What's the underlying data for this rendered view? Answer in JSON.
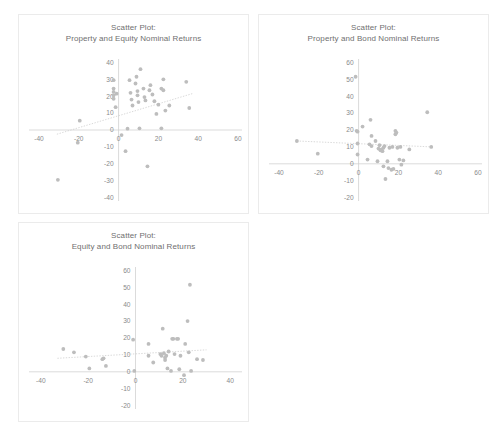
{
  "page": {
    "background": "#ffffff",
    "marker_color": "#bdbdbd",
    "axis_color": "#d2d2d2",
    "trend_color": "#cfcfcf",
    "label_color": "#8a8a8a",
    "title_color": "#6f6f6f",
    "panel_border_color": "#ebebeb"
  },
  "chart_data": [
    {
      "id": "property-equity",
      "type": "scatter",
      "title": "Scatter Plot:",
      "subtitle": "Property and Equity Nominal Returns",
      "xlabel": "",
      "ylabel": "",
      "xlim": [
        -45,
        62
      ],
      "ylim": [
        -42,
        42
      ],
      "xticks": [
        -40,
        -20,
        0,
        20,
        40,
        60
      ],
      "yticks": [
        -40,
        -30,
        -20,
        -10,
        0,
        10,
        20,
        30,
        40
      ],
      "grid": false,
      "legend": "none",
      "trendline": {
        "x0": -31,
        "y0": -2.5,
        "x1": 37,
        "y1": 21.5
      },
      "points": [
        [
          -30.5,
          -29.5
        ],
        [
          -20.5,
          -7.5
        ],
        [
          -19.5,
          5.5
        ],
        [
          -2.5,
          24.5
        ],
        [
          -2.5,
          22.5
        ],
        [
          -2.5,
          20.5
        ],
        [
          -2.5,
          18.5
        ],
        [
          -2.5,
          29.5
        ],
        [
          -1.5,
          13.5
        ],
        [
          -1.0,
          21.5
        ],
        [
          1.5,
          -3.0
        ],
        [
          3.5,
          -12.5
        ],
        [
          4.5,
          0.8
        ],
        [
          5.5,
          29.5
        ],
        [
          6.0,
          22.0
        ],
        [
          6.5,
          18.0
        ],
        [
          7.0,
          14.5
        ],
        [
          8.5,
          27.5
        ],
        [
          9.0,
          31.5
        ],
        [
          9.5,
          23.0
        ],
        [
          9.5,
          20.5
        ],
        [
          10.0,
          16.5
        ],
        [
          10.5,
          1.0
        ],
        [
          11.0,
          36.0
        ],
        [
          12.5,
          24.5
        ],
        [
          13.0,
          19.5
        ],
        [
          13.5,
          17.5
        ],
        [
          14.5,
          -21.5
        ],
        [
          15.5,
          23.5
        ],
        [
          16.0,
          26.5
        ],
        [
          17.0,
          21.0
        ],
        [
          18.0,
          17.0
        ],
        [
          19.0,
          9.5
        ],
        [
          20.0,
          15.0
        ],
        [
          21.5,
          1.0
        ],
        [
          21.5,
          24.5
        ],
        [
          22.5,
          23.5
        ],
        [
          22.5,
          30.0
        ],
        [
          23.5,
          11.5
        ],
        [
          25.5,
          14.5
        ],
        [
          34.0,
          28.5
        ],
        [
          35.5,
          13.0
        ]
      ]
    },
    {
      "id": "property-bond",
      "type": "scatter",
      "title": "Scatter Plot:",
      "subtitle": "Property and Bond Nominal Returns",
      "xlabel": "",
      "ylabel": "",
      "xlim": [
        -45,
        62
      ],
      "ylim": [
        -22,
        62
      ],
      "xticks": [
        -40,
        -20,
        0,
        20,
        40,
        60
      ],
      "yticks": [
        -20,
        -10,
        0,
        10,
        20,
        30,
        40,
        50,
        60
      ],
      "grid": false,
      "legend": "none",
      "trendline": {
        "x0": -31,
        "y0": 13.5,
        "x1": 37,
        "y1": 10.0
      },
      "points": [
        [
          -31.0,
          13.5
        ],
        [
          -20.5,
          6.0
        ],
        [
          -1.5,
          51.5
        ],
        [
          -1.0,
          19.5
        ],
        [
          -0.5,
          19.0
        ],
        [
          -0.5,
          12.0
        ],
        [
          -0.5,
          5.5
        ],
        [
          2.0,
          22.0
        ],
        [
          4.5,
          2.5
        ],
        [
          5.5,
          11.5
        ],
        [
          6.0,
          26.0
        ],
        [
          6.5,
          16.5
        ],
        [
          6.5,
          10.5
        ],
        [
          8.5,
          13.5
        ],
        [
          9.5,
          1.5
        ],
        [
          10.0,
          9.0
        ],
        [
          10.5,
          11.0
        ],
        [
          11.0,
          8.0
        ],
        [
          11.5,
          8.5
        ],
        [
          12.0,
          7.5
        ],
        [
          12.5,
          9.5
        ],
        [
          12.5,
          -1.5
        ],
        [
          13.0,
          10.5
        ],
        [
          13.5,
          -9.0
        ],
        [
          14.5,
          1.5
        ],
        [
          15.0,
          -2.5
        ],
        [
          15.5,
          9.5
        ],
        [
          16.5,
          -3.5
        ],
        [
          17.0,
          10.0
        ],
        [
          17.5,
          -3.0
        ],
        [
          18.5,
          19.5
        ],
        [
          18.5,
          17.5
        ],
        [
          19.0,
          18.5
        ],
        [
          19.5,
          9.5
        ],
        [
          20.5,
          2.5
        ],
        [
          21.0,
          10.0
        ],
        [
          21.5,
          -0.5
        ],
        [
          22.5,
          2.0
        ],
        [
          25.5,
          8.5
        ],
        [
          34.5,
          30.5
        ],
        [
          36.5,
          10.0
        ]
      ]
    },
    {
      "id": "equity-bond",
      "type": "scatter",
      "title": "Scatter Plot:",
      "subtitle": "Equity and Bond Nominal Returns",
      "xlabel": "",
      "ylabel": "",
      "xlim": [
        -45,
        45
      ],
      "ylim": [
        -22,
        62
      ],
      "xticks": [
        -40,
        -20,
        0,
        20,
        40
      ],
      "yticks": [
        -20,
        -10,
        0,
        10,
        20,
        30,
        40,
        50,
        60
      ],
      "grid": false,
      "legend": "none",
      "trendline": {
        "x0": -33,
        "y0": 8.0,
        "x1": 30,
        "y1": 13.0
      },
      "points": [
        [
          -30.5,
          13.5
        ],
        [
          -26.0,
          11.5
        ],
        [
          -21.0,
          9.0
        ],
        [
          -19.5,
          2.0
        ],
        [
          -14.0,
          7.5
        ],
        [
          -13.5,
          8.0
        ],
        [
          -12.5,
          3.5
        ],
        [
          -1.0,
          19.0
        ],
        [
          -0.5,
          0.5
        ],
        [
          5.5,
          16.5
        ],
        [
          5.5,
          9.5
        ],
        [
          7.5,
          5.5
        ],
        [
          10.5,
          10.5
        ],
        [
          11.0,
          9.5
        ],
        [
          11.5,
          25.5
        ],
        [
          12.0,
          11.0
        ],
        [
          12.5,
          8.5
        ],
        [
          12.5,
          7.0
        ],
        [
          13.0,
          9.5
        ],
        [
          13.5,
          2.0
        ],
        [
          14.0,
          12.0
        ],
        [
          15.0,
          0.5
        ],
        [
          15.5,
          19.5
        ],
        [
          16.0,
          19.5
        ],
        [
          16.5,
          10.5
        ],
        [
          17.5,
          19.5
        ],
        [
          18.0,
          19.5
        ],
        [
          18.5,
          1.5
        ],
        [
          19.0,
          9.5
        ],
        [
          20.5,
          -2.0
        ],
        [
          21.0,
          16.5
        ],
        [
          22.0,
          30.0
        ],
        [
          22.5,
          11.5
        ],
        [
          23.0,
          51.5
        ],
        [
          23.5,
          0.5
        ],
        [
          26.0,
          7.5
        ],
        [
          28.5,
          7.0
        ]
      ]
    }
  ]
}
